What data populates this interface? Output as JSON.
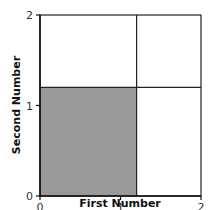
{
  "chart_data": {
    "type": "area",
    "title": "",
    "xlabel": "First Number",
    "ylabel": "Second Number",
    "xlim": [
      0,
      2
    ],
    "ylim": [
      0,
      2
    ],
    "x_ticks": [
      "0",
      "1",
      "2"
    ],
    "y_ticks": [
      "0",
      "1",
      "2"
    ],
    "grid": false,
    "regions": [
      {
        "name": "shaded",
        "x": [
          0,
          1.2
        ],
        "y": [
          0,
          1.2
        ],
        "fill": "#999999"
      },
      {
        "name": "top-left",
        "x": [
          0,
          1.2
        ],
        "y": [
          1.2,
          2
        ],
        "fill": "#ffffff"
      },
      {
        "name": "top-right",
        "x": [
          1.2,
          2
        ],
        "y": [
          1.2,
          2
        ],
        "fill": "#ffffff"
      },
      {
        "name": "bottom-right",
        "x": [
          1.2,
          2
        ],
        "y": [
          0,
          1.2
        ],
        "fill": "#ffffff"
      }
    ],
    "dividers": {
      "x": 1.2,
      "y": 1.2
    }
  },
  "colors": {
    "shade": "#999999",
    "line": "#222222"
  }
}
